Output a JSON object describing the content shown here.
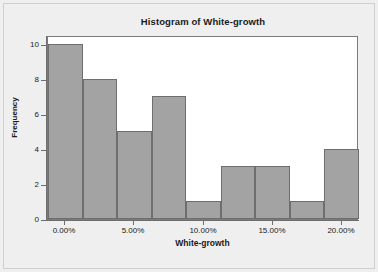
{
  "chart_data": {
    "type": "bar",
    "title": "Histogram of White-growth",
    "xlabel": "White-growth",
    "ylabel": "Frequency",
    "categories": [
      "0.00%",
      "2.50%",
      "5.00%",
      "7.50%",
      "10.00%",
      "12.50%",
      "15.00%",
      "17.50%",
      "20.00%"
    ],
    "values": [
      10,
      8,
      5,
      7,
      1,
      3,
      3,
      1,
      4
    ],
    "bin_starts_pct": [
      -1.25,
      1.25,
      3.75,
      6.25,
      8.75,
      11.25,
      13.75,
      16.25,
      18.75
    ],
    "bin_width_pct": 2.5,
    "xtick_labels": [
      "0.00%",
      "5.00%",
      "10.00%",
      "15.00%",
      "20.00%"
    ],
    "xtick_values": [
      0,
      5,
      10,
      15,
      20
    ],
    "ytick_labels": [
      "0",
      "2",
      "4",
      "6",
      "8",
      "10"
    ],
    "ytick_values": [
      0,
      2,
      4,
      6,
      8,
      10
    ],
    "ylim": [
      0,
      10.5
    ],
    "xlim": [
      -1.25,
      21.25
    ],
    "grid": false,
    "legend": false,
    "bar_fill_color": "#a3a3a3",
    "bar_border_color": "#6e6e6e",
    "plot_background_color": "#ffffff",
    "page_background_color": "#efefef",
    "axis_color": "#6e6e6e",
    "text_color": "#1a1a1a"
  }
}
